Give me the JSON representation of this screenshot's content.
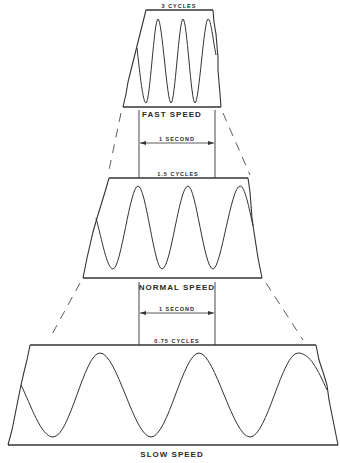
{
  "diagram": {
    "panels": [
      {
        "id": "fast",
        "cycles_label": "3 CYCLES",
        "speed_label": "FAST SPEED",
        "cycles": 3
      },
      {
        "id": "normal",
        "cycles_label": "1.5 CYCLES",
        "speed_label": "NORMAL SPEED",
        "cycles": 1.5
      },
      {
        "id": "slow",
        "cycles_label": "0.75 CYCLES",
        "speed_label": "SLOW SPEED",
        "cycles": 0.75
      }
    ],
    "interval_labels": [
      "1 SECOND",
      "1 SECOND"
    ],
    "colors": {
      "line": "#333333",
      "background": "#ffffff"
    }
  }
}
